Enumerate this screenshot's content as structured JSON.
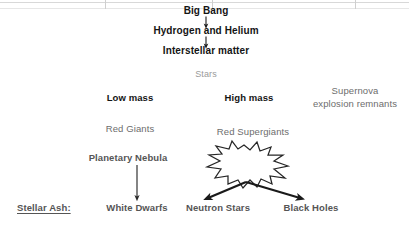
{
  "diagram": {
    "nodes": {
      "big_bang": "Big Bang",
      "hydrogen_helium": "Hydrogen and Helium",
      "interstellar_matter": "Interstellar matter",
      "stars": "Stars",
      "low_mass": "Low mass",
      "high_mass": "High mass",
      "supernova_remnants_line1": "Supernova",
      "supernova_remnants_line2": "explosion remnants",
      "red_giants": "Red Giants",
      "red_supergiants": "Red Supergiants",
      "planetary_nebula": "Planetary Nebula",
      "supernova": "Supernova",
      "stellar_ash": "Stellar Ash:",
      "white_dwarfs": "White Dwarfs",
      "neutron_stars": "Neutron Stars",
      "black_holes": "Black Holes"
    },
    "footer_fragment": "",
    "colors": {
      "text_dark": "#141414",
      "text_gray": "#6d6d6d",
      "text_light_gray": "#9a9a9a",
      "arrow": "#202020",
      "grid_line": "#d8d8d8",
      "background": "#ffffff"
    }
  }
}
